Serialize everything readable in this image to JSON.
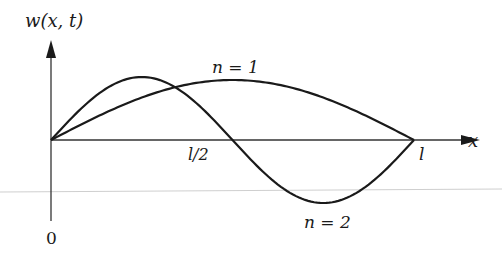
{
  "diagram": {
    "type": "mode-shapes",
    "y_axis_label": "w(x, t)",
    "x_axis_label": "x",
    "origin_label": "0",
    "tick_labels": {
      "half": "l/2",
      "end": "l"
    },
    "curves": [
      {
        "id": "mode-1",
        "label": "n = 1",
        "description": "half sine wave, single hump above axis"
      },
      {
        "id": "mode-2",
        "label": "n = 2",
        "description": "full sine wave, positive hump then negative trough, zero at l/2"
      }
    ],
    "colors": {
      "line": "#1a1a1a",
      "axis": "#333333",
      "artifact_line": "#c8c8c8"
    }
  }
}
